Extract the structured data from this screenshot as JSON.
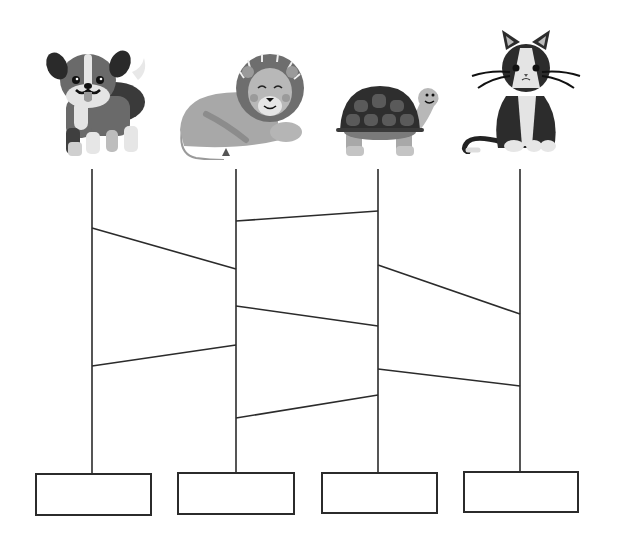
{
  "worksheet": {
    "type": "ladder-puzzle",
    "title": "Follow the lines to match each animal to a box",
    "background": "#ffffff",
    "line_color": "#2b2b2b",
    "line_width": 1.6
  },
  "animals": [
    {
      "name": "dog",
      "label": "Dog",
      "x": 40,
      "y": 38,
      "w": 112,
      "h": 120
    },
    {
      "name": "lion",
      "label": "Lion",
      "x": 176,
      "y": 52,
      "w": 128,
      "h": 108
    },
    {
      "name": "turtle",
      "label": "Turtle",
      "x": 336,
      "y": 80,
      "w": 108,
      "h": 78
    },
    {
      "name": "cat",
      "label": "Cat",
      "x": 458,
      "y": 26,
      "w": 128,
      "h": 128
    }
  ],
  "ladder": {
    "verticals": [
      {
        "x": 92,
        "y1": 169,
        "y2": 473
      },
      {
        "x": 236,
        "y1": 169,
        "y2": 472
      },
      {
        "x": 378,
        "y1": 169,
        "y2": 472
      },
      {
        "x": 520,
        "y1": 169,
        "y2": 471
      }
    ],
    "rungs": [
      {
        "from_col": 1,
        "to_col": 2,
        "x1": 92,
        "y1": 228,
        "x2": 236,
        "y2": 269
      },
      {
        "from_col": 1,
        "to_col": 2,
        "x1": 92,
        "y1": 366,
        "x2": 236,
        "y2": 345
      },
      {
        "from_col": 2,
        "to_col": 3,
        "x1": 236,
        "y1": 221,
        "x2": 378,
        "y2": 211
      },
      {
        "from_col": 2,
        "to_col": 3,
        "x1": 236,
        "y1": 306,
        "x2": 378,
        "y2": 326
      },
      {
        "from_col": 2,
        "to_col": 3,
        "x1": 236,
        "y1": 418,
        "x2": 378,
        "y2": 395
      },
      {
        "from_col": 3,
        "to_col": 4,
        "x1": 378,
        "y1": 265,
        "x2": 520,
        "y2": 314
      },
      {
        "from_col": 3,
        "to_col": 4,
        "x1": 378,
        "y1": 369,
        "x2": 520,
        "y2": 386
      }
    ]
  },
  "answer_boxes": [
    {
      "x": 35,
      "y": 473,
      "w": 117,
      "h": 43,
      "value": ""
    },
    {
      "x": 177,
      "y": 472,
      "w": 118,
      "h": 43,
      "value": ""
    },
    {
      "x": 321,
      "y": 472,
      "w": 117,
      "h": 42,
      "value": ""
    },
    {
      "x": 463,
      "y": 471,
      "w": 116,
      "h": 42,
      "value": ""
    }
  ]
}
